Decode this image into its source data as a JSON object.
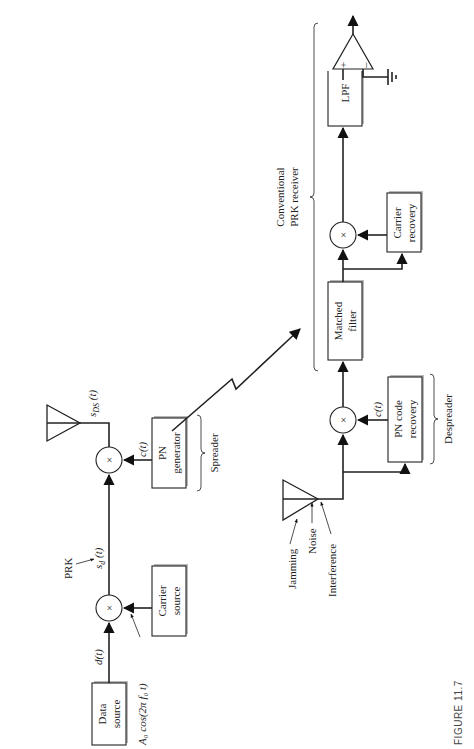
{
  "figure": {
    "caption": "FIGURE 11.7"
  },
  "transmitter": {
    "data_source": [
      "Data",
      "source"
    ],
    "data_signal": "d(t)",
    "carrier_source": [
      "Carrier",
      "source"
    ],
    "carrier_signal": "A₀ cos(2π f₀ t)",
    "prk_label": "PRK",
    "prk_signal": "s",
    "prk_signal_sub": "d",
    "prk_signal_arg": " (t)",
    "mixer_symbol": "×",
    "pn_generator": [
      "PN",
      "generator"
    ],
    "code_signal": "c(t)",
    "spreader_label": "Spreader",
    "ds_signal": "s",
    "ds_signal_sub": "DS",
    "ds_signal_arg": " (t)"
  },
  "channel": {
    "impairments": [
      "Jamming",
      "Noise",
      "Interference"
    ]
  },
  "receiver": {
    "pn_code_recovery": [
      "PN code",
      "recovery"
    ],
    "code_signal": "c(t)",
    "despreader_label": "Despreader",
    "matched_filter": [
      "Matched",
      "filter"
    ],
    "mixer_symbol": "×",
    "carrier_recovery": [
      "Carrier",
      "recovery"
    ],
    "lpf": "LPF",
    "comparator_plus": "+",
    "comparator_minus": "–",
    "conventional_label": [
      "Conventional",
      "PRK receiver"
    ]
  }
}
